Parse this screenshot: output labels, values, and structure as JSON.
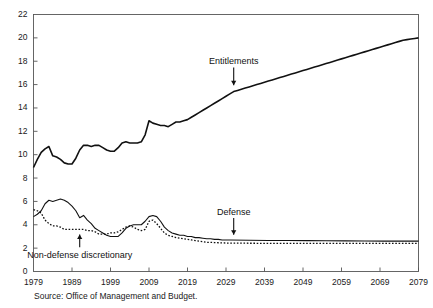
{
  "source_note": "Source: Office of Management and Budget.",
  "annotations": {
    "entitlements": "Entitlements",
    "defense": "Defense",
    "nondefense": "Non-defense discretionary"
  },
  "axis": {
    "y_ticks": [
      "0",
      "2",
      "4",
      "6",
      "8",
      "10",
      "12",
      "14",
      "16",
      "18",
      "20",
      "22"
    ],
    "x_ticks": [
      "1979",
      "1989",
      "1999",
      "2009",
      "2019",
      "2029",
      "2039",
      "2049",
      "2059",
      "2069",
      "2079"
    ]
  },
  "chart_data": {
    "type": "line",
    "title": "",
    "subtitle": "",
    "xlabel": "",
    "ylabel": "",
    "xlim": [
      1979,
      2079
    ],
    "ylim": [
      0,
      22
    ],
    "y_tick_step": 2,
    "x_tick_step": 10,
    "grid": false,
    "legend": "annotations-inline",
    "note": "Source: Office of Management and Budget.",
    "series": [
      {
        "name": "Entitlements",
        "style": "solid",
        "linewidth": 1.6,
        "color": "#111111",
        "x": [
          1979,
          1980,
          1981,
          1982,
          1983,
          1984,
          1985,
          1986,
          1987,
          1988,
          1989,
          1990,
          1991,
          1992,
          1993,
          1994,
          1995,
          1996,
          1997,
          1998,
          1999,
          2000,
          2001,
          2002,
          2003,
          2004,
          2005,
          2006,
          2007,
          2008,
          2009,
          2010,
          2011,
          2012,
          2013,
          2014,
          2015,
          2016,
          2017,
          2018,
          2019,
          2020,
          2021,
          2022,
          2023,
          2024,
          2025,
          2026,
          2027,
          2028,
          2029,
          2030,
          2031,
          2032,
          2033,
          2034,
          2035,
          2036,
          2037,
          2038,
          2039,
          2040,
          2041,
          2042,
          2043,
          2044,
          2045,
          2046,
          2047,
          2048,
          2049,
          2050,
          2051,
          2052,
          2053,
          2054,
          2055,
          2056,
          2057,
          2058,
          2059,
          2060,
          2061,
          2062,
          2063,
          2064,
          2065,
          2066,
          2067,
          2068,
          2069,
          2070,
          2071,
          2072,
          2073,
          2074,
          2075,
          2076,
          2077,
          2078,
          2079
        ],
        "values": [
          8.9,
          9.6,
          10.2,
          10.5,
          10.7,
          9.9,
          9.8,
          9.6,
          9.3,
          9.2,
          9.2,
          9.7,
          10.4,
          10.8,
          10.8,
          10.7,
          10.8,
          10.8,
          10.6,
          10.4,
          10.3,
          10.3,
          10.6,
          11.0,
          11.1,
          11.0,
          11.0,
          11.0,
          11.1,
          11.7,
          12.9,
          12.7,
          12.6,
          12.5,
          12.5,
          12.4,
          12.6,
          12.8,
          12.8,
          12.9,
          13.0,
          13.2,
          13.4,
          13.6,
          13.8,
          14.0,
          14.2,
          14.4,
          14.6,
          14.8,
          15.0,
          15.2,
          15.4,
          15.5,
          15.6,
          15.7,
          15.8,
          15.9,
          16.0,
          16.1,
          16.2,
          16.3,
          16.4,
          16.5,
          16.6,
          16.7,
          16.8,
          16.9,
          17.0,
          17.1,
          17.2,
          17.3,
          17.4,
          17.5,
          17.6,
          17.7,
          17.8,
          17.9,
          18.0,
          18.1,
          18.2,
          18.3,
          18.4,
          18.5,
          18.6,
          18.7,
          18.8,
          18.9,
          19.0,
          19.1,
          19.2,
          19.3,
          19.4,
          19.5,
          19.6,
          19.7,
          19.8,
          19.85,
          19.9,
          19.95,
          20.0
        ]
      },
      {
        "name": "Defense",
        "style": "solid",
        "linewidth": 1.1,
        "color": "#111111",
        "x": [
          1979,
          1980,
          1981,
          1982,
          1983,
          1984,
          1985,
          1986,
          1987,
          1988,
          1989,
          1990,
          1991,
          1992,
          1993,
          1994,
          1995,
          1996,
          1997,
          1998,
          1999,
          2000,
          2001,
          2002,
          2003,
          2004,
          2005,
          2006,
          2007,
          2008,
          2009,
          2010,
          2011,
          2012,
          2013,
          2014,
          2015,
          2016,
          2017,
          2018,
          2019,
          2020,
          2021,
          2022,
          2023,
          2024,
          2025,
          2026,
          2027,
          2028,
          2029,
          2030,
          2035,
          2040,
          2045,
          2050,
          2055,
          2060,
          2065,
          2070,
          2075,
          2079
        ],
        "values": [
          4.7,
          4.9,
          5.2,
          5.8,
          6.1,
          6.0,
          6.1,
          6.2,
          6.1,
          5.9,
          5.6,
          5.2,
          4.6,
          4.8,
          4.4,
          4.1,
          3.7,
          3.5,
          3.3,
          3.1,
          3.0,
          3.0,
          3.0,
          3.3,
          3.7,
          3.9,
          4.0,
          4.0,
          4.0,
          4.3,
          4.7,
          4.8,
          4.7,
          4.3,
          3.8,
          3.5,
          3.3,
          3.2,
          3.1,
          3.1,
          3.0,
          3.0,
          2.9,
          2.9,
          2.85,
          2.8,
          2.8,
          2.75,
          2.75,
          2.7,
          2.7,
          2.7,
          2.68,
          2.66,
          2.65,
          2.64,
          2.63,
          2.62,
          2.61,
          2.6,
          2.6,
          2.6
        ]
      },
      {
        "name": "Non-defense discretionary",
        "style": "dotted",
        "linewidth": 1.3,
        "color": "#111111",
        "x": [
          1979,
          1980,
          1981,
          1982,
          1983,
          1984,
          1985,
          1986,
          1987,
          1988,
          1989,
          1990,
          1991,
          1992,
          1993,
          1994,
          1995,
          1996,
          1997,
          1998,
          1999,
          2000,
          2001,
          2002,
          2003,
          2004,
          2005,
          2006,
          2007,
          2008,
          2009,
          2010,
          2011,
          2012,
          2013,
          2014,
          2015,
          2016,
          2017,
          2018,
          2019,
          2020,
          2021,
          2022,
          2023,
          2024,
          2025,
          2026,
          2027,
          2028,
          2029,
          2030,
          2035,
          2040,
          2045,
          2050,
          2055,
          2060,
          2065,
          2070,
          2075,
          2079
        ],
        "values": [
          5.3,
          5.2,
          5.0,
          4.4,
          4.1,
          3.9,
          3.9,
          3.8,
          3.6,
          3.6,
          3.6,
          3.6,
          3.6,
          3.6,
          3.5,
          3.5,
          3.4,
          3.2,
          3.2,
          3.2,
          3.3,
          3.3,
          3.4,
          3.6,
          3.8,
          3.9,
          3.8,
          3.6,
          3.5,
          3.6,
          4.3,
          4.4,
          4.1,
          3.7,
          3.3,
          3.1,
          3.0,
          2.9,
          2.85,
          2.8,
          2.75,
          2.7,
          2.65,
          2.6,
          2.55,
          2.5,
          2.5,
          2.48,
          2.46,
          2.45,
          2.44,
          2.43,
          2.42,
          2.41,
          2.4,
          2.4,
          2.4,
          2.4,
          2.4,
          2.4,
          2.4,
          2.4
        ]
      }
    ],
    "annotations": [
      {
        "text": "Entitlements",
        "x": 2031,
        "y": 17.9,
        "arrow": "down",
        "target_y": 15.6
      },
      {
        "text": "Defense",
        "x": 2031,
        "y": 5.0,
        "arrow": "down",
        "target_y": 2.8
      },
      {
        "text": "Non-defense discretionary",
        "x": 1991,
        "y": 1.3,
        "arrow": "up",
        "target_y": 3.5
      }
    ]
  }
}
